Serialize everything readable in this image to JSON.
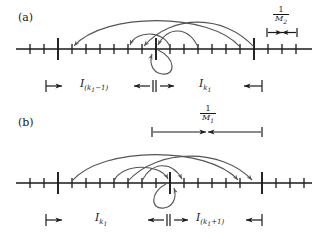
{
  "figure": {
    "background": "#ffffff",
    "ink": "#1a1a1a",
    "arc_color": "#555555",
    "width": 324,
    "height": 239
  },
  "panels": [
    {
      "tag": "(a)",
      "axis": {
        "y": 49,
        "x_start": 16,
        "x_end": 312,
        "minor_tick_half_height": 5,
        "major_tick_half_height": 11,
        "minor_ticks_x": [
          30,
          44,
          58,
          72,
          86,
          100,
          114,
          128,
          142,
          170,
          184,
          198,
          212,
          226,
          240,
          254,
          268,
          282,
          296
        ],
        "major_ticks_x": [
          58,
          156,
          254
        ]
      },
      "scale_bracket": {
        "label_numerator": "1",
        "label_denominator": "M",
        "label_denominator_sub": "2",
        "x_left": 268,
        "x_right": 296,
        "y": 32
      },
      "arcs": [
        {
          "from_x": 240,
          "to_x": 72,
          "apex_y": 19,
          "direction": "left"
        },
        {
          "from_x": 254,
          "to_x": 142,
          "apex_y": 21,
          "direction": "left"
        },
        {
          "from_x": 170,
          "to_x": 128,
          "apex_y": 33,
          "direction": "left"
        },
        {
          "from_x": 198,
          "to_x": 156,
          "apex_y": 30,
          "direction": "left"
        }
      ],
      "self_loop": {
        "x": 156,
        "below": true,
        "arrow": "up"
      },
      "interval_labels": [
        {
          "text": "I",
          "sub": "(k",
          "sub2": "1",
          "tail": "−1)",
          "center_x": 103,
          "y": 84
        },
        {
          "text": "I",
          "sub": "k",
          "sub2": "1",
          "tail": "",
          "center_x": 205,
          "y": 84
        }
      ],
      "interval_brackets": [
        {
          "left_x": 46,
          "right_x": 156,
          "y": 86
        },
        {
          "left_x": 156,
          "right_x": 262,
          "y": 86
        }
      ]
    },
    {
      "tag": "(b)",
      "axis": {
        "y": 183,
        "x_start": 16,
        "x_end": 312,
        "minor_tick_half_height": 5,
        "major_tick_half_height": 11,
        "minor_ticks_x": [
          30,
          44,
          72,
          86,
          100,
          114,
          128,
          142,
          156,
          184,
          198,
          212,
          226,
          240,
          254,
          268,
          282,
          296
        ],
        "major_ticks_x": [
          58,
          170,
          262
        ]
      },
      "scale_bracket": {
        "label_numerator": "1",
        "label_denominator": "M",
        "label_denominator_sub": "1",
        "x_left": 152,
        "x_right": 262,
        "y": 131
      },
      "arcs": [
        {
          "from_x": 72,
          "to_x": 240,
          "apex_y": 153,
          "direction": "right"
        },
        {
          "from_x": 128,
          "to_x": 254,
          "apex_y": 155,
          "direction": "right"
        },
        {
          "from_x": 142,
          "to_x": 184,
          "apex_y": 167,
          "direction": "right"
        },
        {
          "from_x": 114,
          "to_x": 170,
          "apex_y": 164,
          "direction": "right"
        }
      ],
      "self_loop": {
        "x": 170,
        "below": true,
        "arrow": "up"
      },
      "interval_labels": [
        {
          "text": "I",
          "sub": "k",
          "sub2": "1",
          "tail": "",
          "center_x": 103,
          "y": 218
        },
        {
          "text": "I",
          "sub": "(k",
          "sub2": "1",
          "tail": "+1)",
          "center_x": 212,
          "y": 218
        },
        {
          "text": "",
          "sub": "",
          "sub2": "",
          "tail": "",
          "center_x": 0,
          "y": 0
        }
      ],
      "interval_brackets": [
        {
          "left_x": 46,
          "right_x": 170,
          "y": 220
        },
        {
          "left_x": 170,
          "right_x": 262,
          "y": 220
        }
      ]
    }
  ]
}
